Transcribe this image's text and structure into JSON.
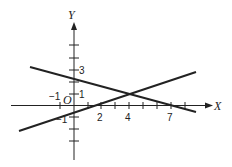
{
  "axes": {
    "x_label": "X",
    "y_label": "Y",
    "origin_label": "O",
    "x_tick_labels": [
      "−1",
      "2",
      "4",
      "7"
    ],
    "y_tick_labels": [
      "3",
      "1",
      "−1"
    ]
  },
  "lines": [
    {
      "name": "descending-line",
      "through": [
        [
          0,
          2.33
        ],
        [
          4,
          1
        ],
        [
          7,
          0
        ]
      ]
    },
    {
      "name": "ascending-line",
      "through": [
        [
          0,
          -0.5
        ],
        [
          1.5,
          0
        ],
        [
          4,
          1
        ]
      ]
    }
  ],
  "intersection": [
    4,
    1
  ]
}
